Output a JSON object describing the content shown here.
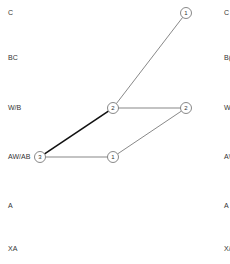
{
  "rows": [
    "C",
    "BC",
    "W/B",
    "AW/AB",
    "A",
    "XA"
  ],
  "right_rows": [
    "C",
    "B(",
    "W",
    "A\\",
    "A",
    "X/"
  ],
  "nodes": [
    {
      "id": "n-top",
      "label": "1",
      "row": "C"
    },
    {
      "id": "n-mid-left",
      "label": "2",
      "row": "W/B"
    },
    {
      "id": "n-mid-right",
      "label": "2",
      "row": "W/B"
    },
    {
      "id": "n-start",
      "label": "3",
      "row": "AW/AB"
    },
    {
      "id": "n-low",
      "label": "1",
      "row": "AW/AB"
    }
  ],
  "edges": [
    {
      "from": "n-start",
      "to": "n-mid-left",
      "weight": "bold"
    },
    {
      "from": "n-start",
      "to": "n-low",
      "weight": "normal"
    },
    {
      "from": "n-mid-left",
      "to": "n-top",
      "weight": "normal"
    },
    {
      "from": "n-mid-left",
      "to": "n-mid-right",
      "weight": "normal"
    },
    {
      "from": "n-low",
      "to": "n-mid-right",
      "weight": "normal"
    }
  ]
}
